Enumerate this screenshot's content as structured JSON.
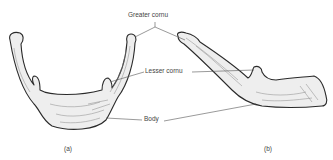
{
  "figure": {
    "labels": {
      "greater_cornu": "Greater cornu",
      "lesser_cornu": "Lesser cornu",
      "body": "Body"
    },
    "panels": [
      {
        "id": "a",
        "caption": "(a)",
        "view": "anterior"
      },
      {
        "id": "b",
        "caption": "(b)",
        "view": "lateral"
      }
    ],
    "colors": {
      "bone_fill": "#eeeeee",
      "bone_outline": "#2a2a2a",
      "shading": "#888888",
      "leader_line": "#555555",
      "text": "#444444"
    }
  }
}
